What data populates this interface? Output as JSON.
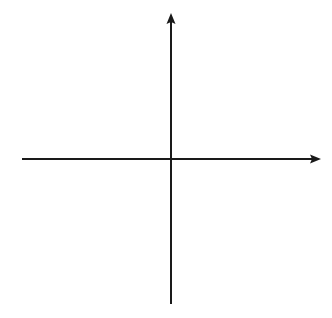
{
  "diagram": {
    "type": "coordinate-axes",
    "background": "#ffffff",
    "stroke_color": "#1a1a1a",
    "stroke_width": 2,
    "x_axis": {
      "x1": 22,
      "y": 159,
      "x2": 321,
      "arrow": "right"
    },
    "y_axis": {
      "x": 171,
      "y1": 304,
      "y2": 13,
      "arrow": "up"
    },
    "labels": []
  }
}
